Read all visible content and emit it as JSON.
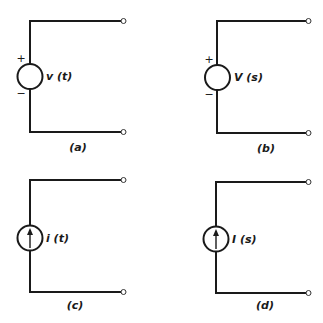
{
  "figure": {
    "panels": [
      {
        "id": "a",
        "caption": "(a)",
        "source_type": "voltage",
        "source_label": "v (t)",
        "polarity_plus": "+",
        "polarity_minus": "−"
      },
      {
        "id": "b",
        "caption": "(b)",
        "source_type": "voltage",
        "source_label": "V (s)",
        "polarity_plus": "+",
        "polarity_minus": "−"
      },
      {
        "id": "c",
        "caption": "(c)",
        "source_type": "current",
        "source_label": "i (t)",
        "arrow_direction": "up"
      },
      {
        "id": "d",
        "caption": "(d)",
        "source_type": "current",
        "source_label": "I (s)",
        "arrow_direction": "up"
      }
    ],
    "colors": {
      "stroke": "#1a1a1a",
      "background": "#ffffff"
    }
  }
}
